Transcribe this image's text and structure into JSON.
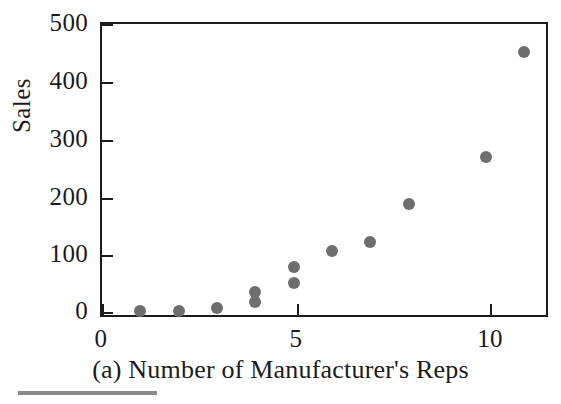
{
  "figure": {
    "caption": "(a) Number of Manufacturer's Reps",
    "ylabel": "Sales",
    "dot_color": "#6e6e6e",
    "axis_color": "#1b1b1b",
    "background": "#ffffff"
  },
  "chart_data": {
    "type": "scatter",
    "title": "",
    "subtitle": "",
    "xlabel": "(a) Number of Manufacturer's Reps",
    "ylabel": "Sales",
    "xlim": [
      0,
      11.55
    ],
    "ylim": [
      0,
      512
    ],
    "xticks": [
      0,
      5,
      10
    ],
    "xtick_labels": [
      "0",
      "5",
      "10"
    ],
    "yticks": [
      0,
      100,
      200,
      300,
      400,
      500
    ],
    "ytick_labels": [
      "0",
      "100",
      "200",
      "300",
      "400",
      "500"
    ],
    "grid": false,
    "legend": null,
    "series": [
      {
        "name": "Sales vs Reps",
        "marker": "circle",
        "color": "#6e6e6e",
        "x": [
          1,
          2,
          3,
          4,
          4,
          5,
          5,
          6,
          7,
          8,
          10,
          11
        ],
        "y": [
          5,
          6,
          11,
          38,
          22,
          83,
          55,
          111,
          128,
          195,
          278,
          462
        ]
      }
    ],
    "points": [
      {
        "x": 1,
        "y": 5
      },
      {
        "x": 2,
        "y": 6
      },
      {
        "x": 3,
        "y": 11
      },
      {
        "x": 4,
        "y": 38
      },
      {
        "x": 4,
        "y": 22
      },
      {
        "x": 5,
        "y": 83
      },
      {
        "x": 5,
        "y": 55
      },
      {
        "x": 6,
        "y": 111
      },
      {
        "x": 7,
        "y": 128
      },
      {
        "x": 8,
        "y": 195
      },
      {
        "x": 10,
        "y": 278
      },
      {
        "x": 11,
        "y": 462
      }
    ]
  }
}
